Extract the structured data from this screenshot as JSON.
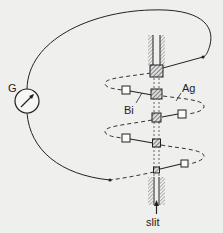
{
  "diagram": {
    "labels": {
      "galvanometer": "G",
      "bismuth": "Bi",
      "silver": "Ag",
      "slit": "slit"
    },
    "colors": {
      "background": "#efefed",
      "line": "#222222",
      "hatch": "#555555"
    },
    "junction_count": 5
  }
}
